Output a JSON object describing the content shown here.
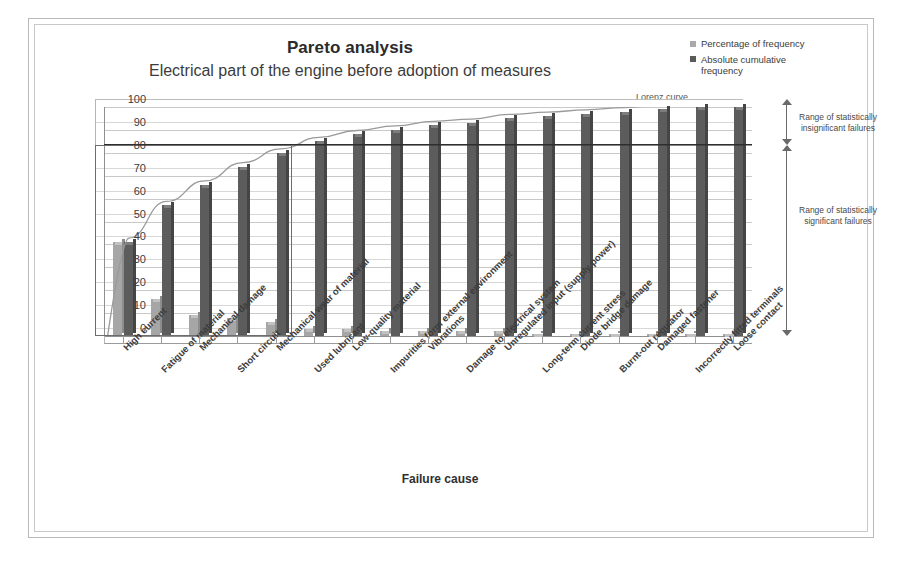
{
  "chart_data": {
    "type": "bar",
    "title": "Pareto analysis",
    "subtitle": "Electrical part of the engine before adoption of measures",
    "xlabel": "Failure cause",
    "ylabel": "Cumulative frequency analysis",
    "ylim": [
      0,
      100
    ],
    "ytick_labels": [
      "0",
      "10",
      "20",
      "30",
      "40",
      "50",
      "60",
      "70",
      "80",
      "90",
      "100"
    ],
    "grid": true,
    "legend_position": "top-right",
    "categories": [
      "High current",
      "Fatigue of material",
      "Mechanical damage",
      "Short circuit",
      "Mechanical wear of material",
      "Used lubricant",
      "Low-quality material",
      "Impurities form external environment",
      "Vibrations",
      "Damage to electrical system",
      "Unregulated input (supply power)",
      "Long-term current stress",
      "Diode bridge damage",
      "Burnt-out regulator",
      "Damaged fastener",
      "Incorrectly fitted terminals",
      "Loose contact"
    ],
    "series": [
      {
        "name": "Percentage of frequency",
        "color": "#a6a6a6",
        "values": [
          41,
          16,
          9,
          8,
          6,
          3,
          3,
          2,
          2,
          2,
          2,
          1,
          1,
          1,
          1,
          1,
          1
        ]
      },
      {
        "name": "Absolute cumulative frequency",
        "color": "#5c5c5c",
        "values": [
          41,
          57,
          66,
          74,
          80,
          85,
          88,
          90,
          92,
          93,
          95,
          96,
          97,
          98,
          99,
          100,
          100
        ]
      }
    ],
    "lorenz_curve": {
      "label": "Lorenz curve",
      "values": [
        41,
        57,
        66,
        74,
        80,
        85,
        88,
        90,
        92,
        93,
        95,
        96,
        97,
        98,
        99,
        100,
        100
      ]
    },
    "threshold_line": {
      "value": 80,
      "label": "80"
    },
    "annotations": [
      {
        "id": "range-insignificant",
        "text": "Range of statistically insignificant failures"
      },
      {
        "id": "range-significant",
        "text": "Range of statistically significant failures"
      }
    ]
  },
  "legend": {
    "items": [
      {
        "label": "Percentage of frequency",
        "swatch": "light"
      },
      {
        "label": "Absolute cumulative frequency",
        "swatch": "dark"
      }
    ]
  }
}
